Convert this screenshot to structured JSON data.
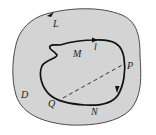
{
  "diagram": {
    "type": "region-with-contour",
    "colors": {
      "region_fill": "#d4d4d4",
      "outer_stroke": "#4a4a4a",
      "curve_stroke": "#111111",
      "dashed_stroke": "#333333",
      "background": "#ffffff"
    },
    "labels": {
      "outer_boundary": "L",
      "region": "D",
      "inner_region": "M",
      "curve_point_top": "l",
      "point_p": "P",
      "point_q": "Q",
      "point_n": "N"
    }
  }
}
